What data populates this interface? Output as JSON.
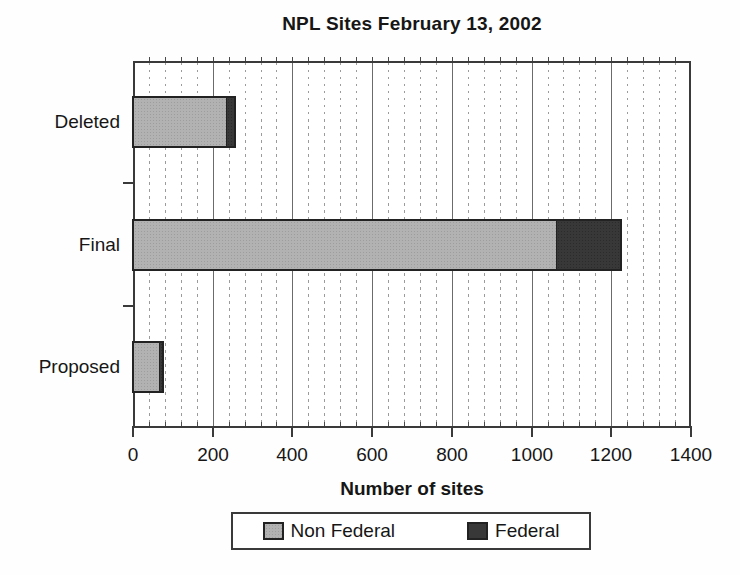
{
  "figure": {
    "title": "NPL Sites February 13, 2002",
    "xlabel": "Number of sites"
  },
  "legend": {
    "items": [
      {
        "label": "Non Federal",
        "color": "#b2b2b2"
      },
      {
        "label": "Federal",
        "color": "#383838"
      }
    ]
  },
  "colors": {
    "non_federal_fill": "#b2b2b2",
    "federal_fill": "#383838",
    "bar_outline": "#222222",
    "plot_frame": "#3a3a3a",
    "major_gridline": "#6b6b6b",
    "minor_gridline": "#9b9b9b",
    "text": "#161616",
    "background": "#fefefe"
  },
  "chart_data": {
    "type": "bar",
    "orientation": "horizontal",
    "stacked": true,
    "title": "NPL Sites February 13, 2002",
    "xlabel": "Number of sites",
    "categories": [
      "Deleted",
      "Final",
      "Proposed"
    ],
    "series": [
      {
        "name": "Non Federal",
        "color": "#b2b2b2",
        "values": [
          232,
          1060,
          63
        ]
      },
      {
        "name": "Federal",
        "color": "#383838",
        "values": [
          20,
          161,
          7
        ]
      }
    ],
    "totals": [
      252,
      1221,
      70
    ],
    "xlim": [
      0,
      1400
    ],
    "xticks": [
      0,
      200,
      400,
      600,
      800,
      1000,
      1200,
      1400
    ],
    "xtick_labels": [
      "0",
      "200",
      "400",
      "600",
      "800",
      "1000",
      "1200",
      "1400"
    ],
    "minor_tick_step": 40,
    "grid": "vertical: solid at major ticks, dashed at minor ticks",
    "legend_position": "bottom-center"
  }
}
